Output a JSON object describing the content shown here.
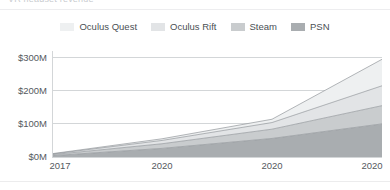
{
  "header": {
    "clipped_title": "VR headset revenue"
  },
  "legend": {
    "position": "top-center",
    "items": [
      {
        "label": "Oculus Quest",
        "color": "#eef0f1",
        "icon": "legend-swatch"
      },
      {
        "label": "Oculus Rift",
        "color": "#e2e4e6",
        "icon": "legend-swatch"
      },
      {
        "label": "Steam",
        "color": "#c9ccce",
        "icon": "legend-swatch"
      },
      {
        "label": "PSN",
        "color": "#a9adb0",
        "icon": "legend-swatch"
      }
    ]
  },
  "chart_data": {
    "type": "area",
    "stacked": true,
    "title": "",
    "subtitle": "",
    "xlabel": "",
    "ylabel": "",
    "grid": true,
    "ylim": [
      0,
      320
    ],
    "ytick_values": [
      0,
      100,
      200,
      300
    ],
    "ytick_labels": [
      "$0M",
      "$100M",
      "$200M",
      "$300M"
    ],
    "x": [
      0,
      1,
      2,
      3
    ],
    "categories": [
      "2017",
      "2020",
      "2020",
      "2020"
    ],
    "xtick_labels": [
      "2017",
      "2020",
      "2020",
      "2020"
    ],
    "series": [
      {
        "name": "PSN",
        "color": "#a9adb0",
        "values": [
          4,
          26,
          56,
          100
        ]
      },
      {
        "name": "Steam",
        "color": "#c9ccce",
        "values": [
          3,
          14,
          28,
          55
        ]
      },
      {
        "name": "Oculus Rift",
        "color": "#e2e4e6",
        "values": [
          2,
          10,
          20,
          60
        ]
      },
      {
        "name": "Oculus Quest",
        "color": "#eef0f1",
        "values": [
          1,
          5,
          10,
          80
        ]
      }
    ],
    "stack_totals": [
      10,
      55,
      114,
      295
    ],
    "line_color": "#8d9297",
    "axis_color": "#d3d6d8",
    "grid_color": "#d3d6d8"
  }
}
